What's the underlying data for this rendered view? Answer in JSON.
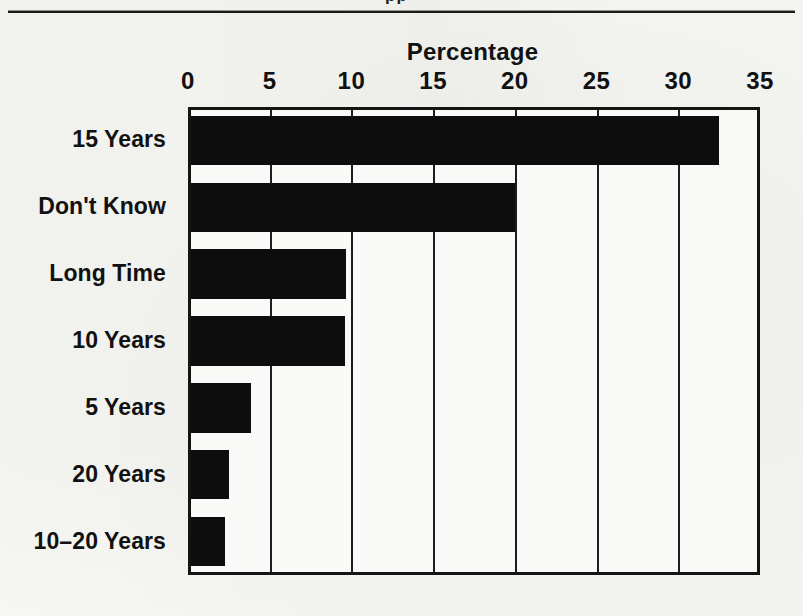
{
  "page": {
    "clipped_header_fragment": "pp",
    "background_color": "#f6f6f3",
    "rule_color": "#1a1a1a"
  },
  "chart_data": {
    "type": "bar",
    "orientation": "horizontal",
    "title": "Percentage",
    "xlabel": "",
    "ylabel": "",
    "categories": [
      "15 Years",
      "Don't Know",
      "Long Time",
      "10 Years",
      "5 Years",
      "20 Years",
      "10–20 Years"
    ],
    "values": [
      32.3,
      19.8,
      9.5,
      9.4,
      3.7,
      2.3,
      2.1
    ],
    "series": [
      {
        "name": "Percentage",
        "values": [
          32.3,
          19.8,
          9.5,
          9.4,
          3.7,
          2.3,
          2.1
        ]
      }
    ],
    "xlim": [
      0,
      35
    ],
    "xticks": [
      0,
      5,
      10,
      15,
      20,
      25,
      30,
      35
    ],
    "xtick_labels": [
      "0",
      "5",
      "10",
      "15",
      "20",
      "25",
      "30",
      "35"
    ],
    "grid": "vertical-only",
    "legend": "none",
    "bar_color": "#0d0d0d",
    "axis_color": "#141414",
    "plot_background": "#f9f9f7"
  }
}
